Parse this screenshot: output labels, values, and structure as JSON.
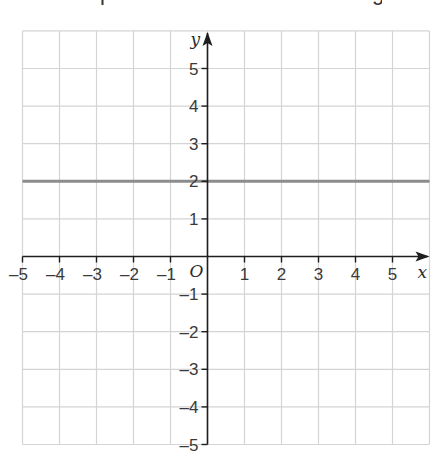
{
  "top_text_fragments": [
    {
      "glyph": "p",
      "x": 100
    },
    {
      "glyph": "g",
      "x": 372
    }
  ],
  "chart_data": {
    "type": "line",
    "title": "",
    "xlabel": "x",
    "ylabel": "y",
    "origin_label": "O",
    "xlim": [
      -5,
      6
    ],
    "ylim": [
      -5,
      6
    ],
    "grid": true,
    "x_ticks": [
      -5,
      -4,
      -3,
      -2,
      -1,
      1,
      2,
      3,
      4,
      5
    ],
    "y_ticks": [
      5,
      4,
      3,
      2,
      1,
      -1,
      -2,
      -3,
      -4,
      -5
    ],
    "x_tick_labels": [
      "–5",
      "–4",
      "–3",
      "–2",
      "–1",
      "1",
      "2",
      "3",
      "4",
      "5"
    ],
    "y_tick_labels": [
      "5",
      "4",
      "3",
      "2",
      "1",
      "–1",
      "–2",
      "–3",
      "–4",
      "–5"
    ],
    "series": [
      {
        "name": "y = 2",
        "x": [
          -5,
          6
        ],
        "y": [
          2,
          2
        ],
        "color": "#8c8c8c"
      }
    ]
  },
  "colors": {
    "grid": "#d4d4d4",
    "axis": "#1e1e1e",
    "line": "#8c8c8c"
  }
}
